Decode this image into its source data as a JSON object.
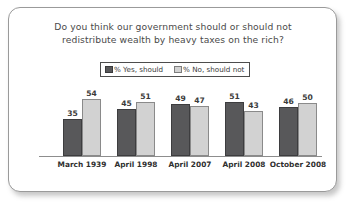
{
  "chart_data": {
    "type": "bar",
    "title_lines": [
      "Do you think our government should or should not",
      "redistribute wealth by heavy taxes on the rich?"
    ],
    "title": "Do you think our government should or should not redistribute wealth by heavy taxes on the rich?",
    "categories": [
      "March 1939",
      "April 1998",
      "April 2007",
      "April 2008",
      "October 2008"
    ],
    "series": [
      {
        "name": "% Yes, should",
        "color": "#58585a",
        "values": [
          35,
          45,
          49,
          51,
          46
        ]
      },
      {
        "name": "% No, should not",
        "color": "#d2d2d2",
        "values": [
          54,
          51,
          47,
          43,
          50
        ]
      }
    ],
    "ylim": [
      0,
      60
    ],
    "xlabel": "",
    "ylabel": "",
    "grid": false,
    "legend_position": "top-center",
    "value_labels": true
  },
  "frame": {
    "border_color": "#9a9a9a",
    "background": "#ffffff"
  }
}
